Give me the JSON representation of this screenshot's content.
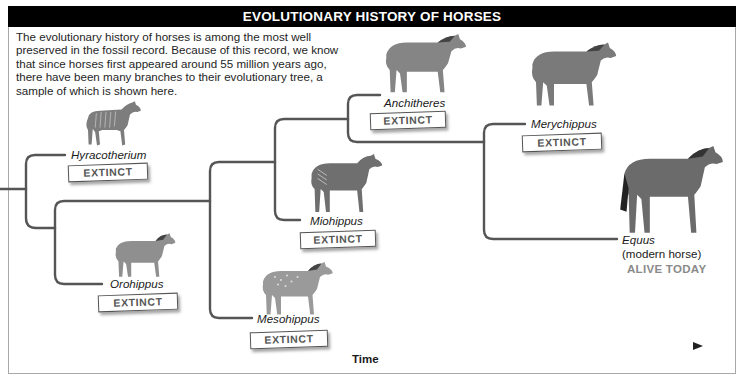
{
  "header": {
    "title": "EVOLUTIONARY HISTORY OF HORSES"
  },
  "intro": {
    "text": "The evolutionary history of horses is among the most well preserved in the fossil record. Because of this record, we know that since horses first appeared around 55 million years ago, there have been many branches to their evolutionary tree, a sample of which is shown here."
  },
  "species": [
    {
      "name": "Hyracotherium",
      "status": "EXTINCT",
      "icon": "horse-icon"
    },
    {
      "name": "Orohippus",
      "status": "EXTINCT",
      "icon": "horse-icon"
    },
    {
      "name": "Mesohippus",
      "status": "EXTINCT",
      "icon": "horse-icon"
    },
    {
      "name": "Miohippus",
      "status": "EXTINCT",
      "icon": "horse-icon"
    },
    {
      "name": "Anchitheres",
      "status": "EXTINCT",
      "icon": "horse-icon"
    },
    {
      "name": "Merychippus",
      "status": "EXTINCT",
      "icon": "horse-icon"
    },
    {
      "name": "Equus",
      "subtitle": "(modern horse)",
      "status": "ALIVE TODAY",
      "icon": "horse-icon"
    }
  ],
  "axis": {
    "label": "Time",
    "direction": "left-to-right"
  },
  "colors": {
    "title_bg": "#000000",
    "title_fg": "#ffffff",
    "branch_line": "#555555",
    "horse_body": "#8a8a8a",
    "alive_text": "#8a8a8a",
    "badge_text": "#555555"
  }
}
